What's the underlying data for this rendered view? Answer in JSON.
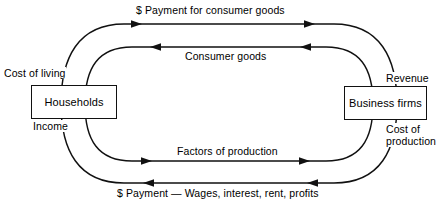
{
  "diagram": {
    "type": "circular-flow-economics",
    "entities": {
      "left": {
        "label": "Households"
      },
      "right": {
        "label": "Business firms"
      }
    },
    "flows": [
      {
        "id": "payment-consumer-goods",
        "label": "$ Payment for consumer goods",
        "direction": "left-to-right",
        "loop": "outer-top"
      },
      {
        "id": "consumer-goods",
        "label": "Consumer goods",
        "direction": "right-to-left",
        "loop": "inner-top"
      },
      {
        "id": "factors-of-production",
        "label": "Factors of production",
        "direction": "left-to-right",
        "loop": "inner-bottom"
      },
      {
        "id": "payment-wages",
        "label": "$ Payment — Wages, interest, rent, profits",
        "direction": "right-to-left",
        "loop": "outer-bottom"
      }
    ],
    "corner_labels": {
      "cost_of_living": "Cost of living",
      "income": "Income",
      "revenue": "Revenue",
      "cost_of_production_line1": "Cost of",
      "cost_of_production_line2": "production"
    },
    "colors": {
      "stroke": "#111111",
      "background": "#ffffff",
      "text": "#000000"
    }
  }
}
